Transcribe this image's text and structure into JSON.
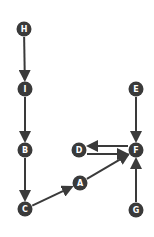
{
  "diagram": {
    "type": "directed-graph",
    "colors": {
      "node_fill": "#3a3a3a",
      "edge": "#3a3a3a",
      "label": "#ffffff",
      "background": "#ffffff"
    },
    "nodes": [
      {
        "id": "H",
        "label": "H",
        "x": 24,
        "y": 29
      },
      {
        "id": "I",
        "label": "I",
        "x": 25,
        "y": 89
      },
      {
        "id": "B",
        "label": "B",
        "x": 25,
        "y": 150
      },
      {
        "id": "C",
        "label": "C",
        "x": 25,
        "y": 209
      },
      {
        "id": "A",
        "label": "A",
        "x": 80,
        "y": 183
      },
      {
        "id": "D",
        "label": "D",
        "x": 79,
        "y": 150
      },
      {
        "id": "F",
        "label": "F",
        "x": 136,
        "y": 150
      },
      {
        "id": "E",
        "label": "E",
        "x": 136,
        "y": 89
      },
      {
        "id": "G",
        "label": "G",
        "x": 136,
        "y": 210
      }
    ],
    "edges": [
      {
        "from": "H",
        "to": "I"
      },
      {
        "from": "I",
        "to": "B"
      },
      {
        "from": "B",
        "to": "C"
      },
      {
        "from": "C",
        "to": "A"
      },
      {
        "from": "A",
        "to": "F"
      },
      {
        "from": "E",
        "to": "F"
      },
      {
        "from": "G",
        "to": "F"
      },
      {
        "from": "F",
        "to": "D",
        "offset": -4
      },
      {
        "from": "D",
        "to": "F",
        "offset": 4
      }
    ]
  }
}
